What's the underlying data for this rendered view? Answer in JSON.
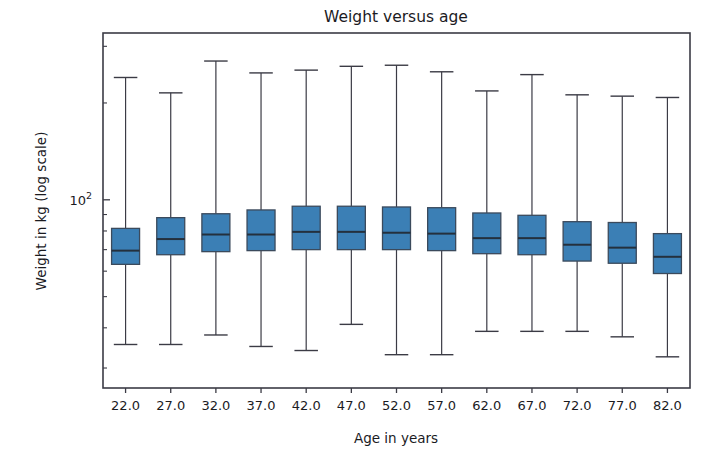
{
  "chart_data": {
    "type": "box",
    "title": "Weight versus age",
    "xlabel": "Age in years",
    "ylabel": "Weight in kg (log scale)",
    "yscale": "log",
    "grid": false,
    "legend": "none",
    "categories": [
      "22.0",
      "27.0",
      "32.0",
      "37.0",
      "42.0",
      "47.0",
      "52.0",
      "57.0",
      "62.0",
      "67.0",
      "72.0",
      "77.0",
      "82.0"
    ],
    "y_major_ticks": [
      {
        "value": 100,
        "label": "10",
        "exponent": "2"
      }
    ],
    "y_minor_ticks": [
      30,
      40,
      50,
      60,
      70,
      80,
      90,
      200,
      300
    ],
    "ylim": [
      26,
      330
    ],
    "xlim": [
      0.5,
      13.5
    ],
    "box_color": "#3b7fb5",
    "box_edge_color": "#3b4a5c",
    "median_color": "#24303d",
    "whisker_color": "#3b3b45",
    "boxes": [
      {
        "category": "22.0",
        "whisker_low": 35.5,
        "q1": 63.0,
        "median": 69.5,
        "q3": 81.5,
        "whisker_high": 240.0
      },
      {
        "category": "27.0",
        "whisker_low": 35.5,
        "q1": 67.5,
        "median": 75.5,
        "q3": 88.0,
        "whisker_high": 215.0
      },
      {
        "category": "32.0",
        "whisker_low": 38.0,
        "q1": 69.0,
        "median": 78.0,
        "q3": 90.5,
        "whisker_high": 270.0
      },
      {
        "category": "37.0",
        "whisker_low": 35.0,
        "q1": 69.5,
        "median": 78.0,
        "q3": 93.0,
        "whisker_high": 248.0
      },
      {
        "category": "42.0",
        "whisker_low": 34.0,
        "q1": 70.0,
        "median": 79.5,
        "q3": 95.5,
        "whisker_high": 253.0
      },
      {
        "category": "47.0",
        "whisker_low": 41.0,
        "q1": 70.0,
        "median": 79.5,
        "q3": 95.5,
        "whisker_high": 260.0
      },
      {
        "category": "52.0",
        "whisker_low": 33.0,
        "q1": 70.0,
        "median": 79.0,
        "q3": 95.0,
        "whisker_high": 262.0
      },
      {
        "category": "57.0",
        "whisker_low": 33.0,
        "q1": 69.5,
        "median": 78.5,
        "q3": 94.5,
        "whisker_high": 250.0
      },
      {
        "category": "62.0",
        "whisker_low": 39.0,
        "q1": 68.0,
        "median": 76.0,
        "q3": 91.0,
        "whisker_high": 218.0
      },
      {
        "category": "67.0",
        "whisker_low": 39.0,
        "q1": 67.5,
        "median": 76.0,
        "q3": 89.5,
        "whisker_high": 245.0
      },
      {
        "category": "72.0",
        "whisker_low": 39.0,
        "q1": 64.5,
        "median": 72.5,
        "q3": 85.5,
        "whisker_high": 212.0
      },
      {
        "category": "77.0",
        "whisker_low": 37.5,
        "q1": 63.5,
        "median": 71.0,
        "q3": 85.0,
        "whisker_high": 210.0
      },
      {
        "category": "82.0",
        "whisker_low": 32.5,
        "q1": 59.0,
        "median": 66.5,
        "q3": 78.5,
        "whisker_high": 208.0
      }
    ]
  }
}
